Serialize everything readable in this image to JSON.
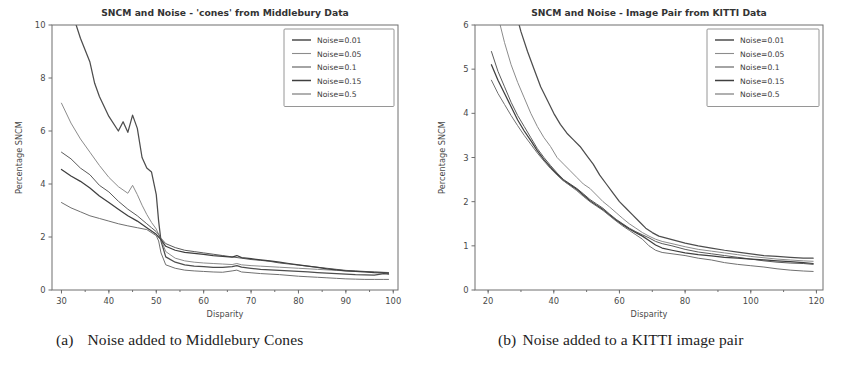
{
  "figure": {
    "panels": [
      {
        "id": "panel-a",
        "caption_label": "(a)",
        "caption_text": "Noise added to Middlebury Cones"
      },
      {
        "id": "panel-b",
        "caption_label": "(b)",
        "caption_text": "Noise added to a KITTI image pair"
      }
    ]
  },
  "chart_data": [
    {
      "type": "line",
      "id": "sncm-middlebury-cones",
      "title": "SNCM and Noise - 'cones' from Middlebury Data",
      "xlabel": "Disparity",
      "ylabel": "Percentage SNCM",
      "xlim": [
        28,
        101
      ],
      "ylim": [
        0,
        10
      ],
      "xticks": [
        30,
        40,
        50,
        60,
        70,
        80,
        90,
        100
      ],
      "yticks": [
        0,
        2,
        4,
        6,
        8,
        10
      ],
      "grid": false,
      "legend_position": "upper right",
      "legend_title": "",
      "series": [
        {
          "name": "Noise=0.01",
          "color": "#4d4d4d",
          "x": [
            30,
            32,
            34,
            36,
            37,
            38,
            40,
            42,
            43,
            44,
            45,
            46,
            47,
            48,
            49,
            50,
            50.5,
            51,
            52,
            54,
            56,
            58,
            60,
            62,
            64,
            66,
            67,
            68,
            70,
            72,
            74,
            76,
            78,
            80,
            82,
            84,
            86,
            88,
            90,
            92,
            94,
            96,
            98,
            99
          ],
          "y": [
            11.8,
            10.6,
            9.5,
            8.6,
            7.8,
            7.3,
            6.55,
            6.0,
            6.35,
            5.95,
            6.6,
            6.1,
            5.0,
            4.6,
            4.45,
            3.6,
            2.6,
            1.85,
            1.25,
            1.05,
            0.95,
            0.9,
            0.88,
            0.85,
            0.85,
            0.88,
            0.92,
            0.86,
            0.82,
            0.78,
            0.76,
            0.74,
            0.72,
            0.7,
            0.68,
            0.66,
            0.64,
            0.62,
            0.6,
            0.58,
            0.57,
            0.56,
            0.62,
            0.6
          ]
        },
        {
          "name": "Noise=0.05",
          "color": "#8c8c8c",
          "x": [
            30,
            32,
            34,
            36,
            38,
            40,
            42,
            44,
            45,
            46,
            47,
            48,
            49,
            50,
            50.5,
            51,
            52,
            54,
            56,
            58,
            60,
            62,
            64,
            66,
            67,
            68,
            70,
            72,
            74,
            76,
            78,
            80,
            82,
            84,
            86,
            88,
            90,
            92,
            94,
            96,
            98,
            99
          ],
          "y": [
            7.05,
            6.3,
            5.7,
            5.2,
            4.7,
            4.25,
            3.9,
            3.65,
            3.95,
            3.6,
            3.2,
            2.85,
            2.55,
            2.3,
            2.1,
            1.9,
            1.45,
            1.2,
            1.1,
            1.05,
            1.02,
            1.0,
            0.98,
            0.96,
            1.0,
            0.95,
            0.92,
            0.9,
            0.88,
            0.86,
            0.84,
            0.82,
            0.8,
            0.78,
            0.76,
            0.74,
            0.72,
            0.7,
            0.69,
            0.68,
            0.67,
            0.66
          ]
        },
        {
          "name": "Noise=0.1",
          "color": "#5a5a5a",
          "x": [
            30,
            32,
            34,
            36,
            38,
            40,
            42,
            44,
            46,
            48,
            49,
            50,
            50.5,
            51,
            52,
            54,
            56,
            58,
            60,
            62,
            64,
            66,
            68,
            70,
            72,
            74,
            76,
            78,
            80,
            82,
            84,
            86,
            88,
            90,
            92,
            94,
            96,
            98,
            99
          ],
          "y": [
            5.2,
            4.95,
            4.6,
            4.35,
            3.95,
            3.7,
            3.35,
            3.05,
            2.8,
            2.5,
            2.35,
            2.2,
            2.1,
            1.95,
            1.75,
            1.6,
            1.5,
            1.45,
            1.4,
            1.35,
            1.3,
            1.25,
            1.2,
            1.15,
            1.12,
            1.08,
            1.02,
            0.98,
            0.94,
            0.9,
            0.86,
            0.82,
            0.78,
            0.74,
            0.72,
            0.7,
            0.68,
            0.66,
            0.64
          ]
        },
        {
          "name": "Noise=0.15",
          "color": "#3f3f3f",
          "x": [
            30,
            32,
            34,
            36,
            38,
            40,
            42,
            44,
            46,
            48,
            50,
            50.5,
            51,
            52,
            54,
            56,
            58,
            60,
            62,
            64,
            66,
            67,
            68,
            70,
            72,
            74,
            76,
            78,
            80,
            82,
            84,
            86,
            88,
            90,
            92,
            94,
            96,
            98,
            99
          ],
          "y": [
            4.55,
            4.3,
            4.1,
            3.85,
            3.55,
            3.3,
            3.05,
            2.8,
            2.6,
            2.35,
            2.1,
            2.0,
            1.9,
            1.65,
            1.5,
            1.42,
            1.38,
            1.34,
            1.3,
            1.27,
            1.24,
            1.3,
            1.22,
            1.18,
            1.14,
            1.1,
            1.05,
            1.0,
            0.95,
            0.9,
            0.85,
            0.8,
            0.76,
            0.72,
            0.7,
            0.68,
            0.66,
            0.65,
            0.64
          ]
        },
        {
          "name": "Noise=0.5",
          "color": "#707070",
          "x": [
            30,
            32,
            34,
            36,
            38,
            40,
            42,
            44,
            46,
            48,
            50,
            50.5,
            51,
            52,
            54,
            56,
            58,
            60,
            62,
            64,
            66,
            67,
            68,
            70,
            72,
            74,
            76,
            78,
            80,
            82,
            84,
            86,
            88,
            90,
            92,
            94,
            96,
            98,
            99
          ],
          "y": [
            3.3,
            3.1,
            2.95,
            2.8,
            2.7,
            2.6,
            2.5,
            2.42,
            2.35,
            2.28,
            2.05,
            1.85,
            1.4,
            0.95,
            0.82,
            0.75,
            0.72,
            0.7,
            0.68,
            0.67,
            0.72,
            0.75,
            0.68,
            0.65,
            0.62,
            0.6,
            0.58,
            0.55,
            0.52,
            0.5,
            0.48,
            0.46,
            0.44,
            0.42,
            0.41,
            0.4,
            0.4,
            0.4,
            0.4
          ]
        }
      ]
    },
    {
      "type": "line",
      "id": "sncm-kitti-image-pair",
      "title": "SNCM and Noise - Image Pair from KITTI Data",
      "xlabel": "Disparity",
      "ylabel": "Percentage SNCM",
      "xlim": [
        16,
        122
      ],
      "ylim": [
        0,
        6
      ],
      "xticks": [
        20,
        40,
        60,
        80,
        100,
        120
      ],
      "yticks": [
        0,
        1,
        2,
        3,
        4,
        5,
        6
      ],
      "grid": false,
      "legend_position": "upper right",
      "legend_title": "",
      "series": [
        {
          "name": "Noise=0.01",
          "color": "#4d4d4d",
          "x": [
            28,
            30,
            32,
            34,
            36,
            38,
            40,
            42,
            44,
            46,
            48,
            50,
            52,
            54,
            56,
            58,
            60,
            62,
            64,
            66,
            68,
            70,
            72,
            74,
            76,
            78,
            80,
            84,
            88,
            92,
            96,
            100,
            104,
            108,
            112,
            116,
            119
          ],
          "y": [
            6.4,
            5.85,
            5.4,
            5.0,
            4.6,
            4.3,
            4.0,
            3.75,
            3.55,
            3.4,
            3.25,
            3.05,
            2.85,
            2.6,
            2.4,
            2.2,
            2.0,
            1.85,
            1.7,
            1.55,
            1.4,
            1.3,
            1.22,
            1.18,
            1.14,
            1.1,
            1.06,
            1.0,
            0.95,
            0.9,
            0.86,
            0.82,
            0.78,
            0.76,
            0.74,
            0.72,
            0.72
          ]
        },
        {
          "name": "Noise=0.05",
          "color": "#8c8c8c",
          "x": [
            23,
            25,
            27,
            29,
            31,
            33,
            35,
            37,
            39,
            41,
            43,
            45,
            47,
            49,
            51,
            53,
            55,
            57,
            59,
            61,
            63,
            65,
            67,
            69,
            71,
            73,
            76,
            80,
            84,
            88,
            92,
            96,
            100,
            104,
            108,
            112,
            116,
            119
          ],
          "y": [
            6.2,
            5.6,
            5.1,
            4.7,
            4.35,
            4.0,
            3.7,
            3.45,
            3.25,
            3.0,
            2.85,
            2.7,
            2.55,
            2.4,
            2.3,
            2.15,
            2.0,
            1.88,
            1.75,
            1.62,
            1.5,
            1.4,
            1.3,
            1.22,
            1.15,
            1.1,
            1.05,
            0.98,
            0.92,
            0.88,
            0.84,
            0.8,
            0.76,
            0.73,
            0.7,
            0.68,
            0.66,
            0.65
          ]
        },
        {
          "name": "Noise=0.1",
          "color": "#5a5a5a",
          "x": [
            21,
            23,
            25,
            27,
            29,
            31,
            33,
            35,
            37,
            39,
            41,
            43,
            45,
            47,
            49,
            51,
            53,
            55,
            57,
            59,
            61,
            63,
            65,
            67,
            69,
            71,
            73,
            76,
            80,
            84,
            88,
            92,
            96,
            100,
            104,
            108,
            112,
            116,
            119
          ],
          "y": [
            5.4,
            4.95,
            4.6,
            4.25,
            3.95,
            3.7,
            3.45,
            3.2,
            3.0,
            2.82,
            2.65,
            2.5,
            2.4,
            2.3,
            2.18,
            2.05,
            1.95,
            1.85,
            1.72,
            1.6,
            1.5,
            1.4,
            1.32,
            1.25,
            1.18,
            1.1,
            1.05,
            1.0,
            0.92,
            0.86,
            0.82,
            0.78,
            0.74,
            0.7,
            0.66,
            0.63,
            0.61,
            0.6,
            0.58
          ]
        },
        {
          "name": "Noise=0.15",
          "color": "#3f3f3f",
          "x": [
            21,
            23,
            25,
            27,
            29,
            31,
            33,
            35,
            37,
            39,
            41,
            43,
            45,
            47,
            49,
            51,
            53,
            55,
            57,
            59,
            61,
            63,
            65,
            67,
            69,
            71,
            73,
            76,
            80,
            84,
            88,
            92,
            96,
            100,
            104,
            108,
            112,
            116,
            119
          ],
          "y": [
            5.1,
            4.75,
            4.45,
            4.15,
            3.85,
            3.6,
            3.38,
            3.15,
            2.95,
            2.78,
            2.62,
            2.48,
            2.38,
            2.28,
            2.15,
            2.02,
            1.92,
            1.82,
            1.7,
            1.58,
            1.48,
            1.38,
            1.3,
            1.22,
            1.12,
            1.02,
            0.95,
            0.9,
            0.84,
            0.8,
            0.77,
            0.74,
            0.72,
            0.7,
            0.68,
            0.66,
            0.64,
            0.62,
            0.6
          ]
        },
        {
          "name": "Noise=0.5",
          "color": "#707070",
          "x": [
            21,
            23,
            25,
            27,
            29,
            31,
            33,
            35,
            37,
            39,
            41,
            43,
            45,
            47,
            49,
            51,
            53,
            55,
            57,
            59,
            61,
            63,
            65,
            67,
            69,
            71,
            73,
            76,
            80,
            84,
            88,
            92,
            96,
            100,
            104,
            108,
            112,
            116,
            119
          ],
          "y": [
            4.75,
            4.45,
            4.2,
            3.95,
            3.72,
            3.5,
            3.3,
            3.1,
            2.92,
            2.75,
            2.6,
            2.47,
            2.36,
            2.25,
            2.12,
            2.0,
            1.9,
            1.8,
            1.68,
            1.56,
            1.45,
            1.35,
            1.25,
            1.15,
            1.0,
            0.9,
            0.85,
            0.82,
            0.78,
            0.72,
            0.68,
            0.62,
            0.58,
            0.55,
            0.52,
            0.48,
            0.45,
            0.43,
            0.42
          ]
        }
      ]
    }
  ]
}
